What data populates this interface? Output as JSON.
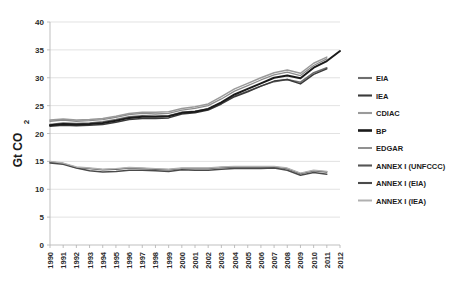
{
  "chart_data": {
    "type": "line",
    "title": "",
    "xlabel": "",
    "ylabel": "Gt CO",
    "ylabel_subscript": "2",
    "ylim": [
      0,
      40
    ],
    "ytick_values": [
      0,
      5,
      10,
      15,
      20,
      25,
      30,
      35,
      40
    ],
    "ytick_labels": [
      "0",
      "5",
      "10",
      "15",
      "20",
      "25",
      "30",
      "35",
      "40"
    ],
    "grid": true,
    "legend_position": "right",
    "x": [
      1990,
      1991,
      1992,
      1993,
      1994,
      1995,
      1996,
      1997,
      1998,
      1999,
      2000,
      2001,
      2002,
      2003,
      2004,
      2005,
      2006,
      2007,
      2008,
      2009,
      2010,
      2011,
      2012
    ],
    "categories": [
      "1990",
      "1991",
      "1992",
      "1993",
      "1994",
      "1995",
      "1996",
      "1997",
      "1998",
      "1999",
      "2000",
      "2001",
      "2002",
      "2003",
      "2004",
      "2005",
      "2006",
      "2007",
      "2008",
      "2009",
      "2010",
      "2011",
      "2012"
    ],
    "series": [
      {
        "name": "EIA",
        "color": "#6e6e6e",
        "width": 1.5,
        "values": [
          21.6,
          21.9,
          21.8,
          21.9,
          22.1,
          22.5,
          23.0,
          23.2,
          23.1,
          23.2,
          23.8,
          24.0,
          24.4,
          25.5,
          26.7,
          27.6,
          28.5,
          29.3,
          29.7,
          29.2,
          30.9,
          31.8,
          null
        ]
      },
      {
        "name": "IEA",
        "color": "#3a3a3a",
        "width": 1.5,
        "values": [
          21.3,
          21.5,
          21.4,
          21.5,
          21.6,
          22.0,
          22.5,
          22.7,
          22.7,
          22.8,
          23.5,
          23.7,
          24.2,
          25.3,
          26.6,
          27.5,
          28.5,
          29.4,
          29.7,
          28.9,
          30.6,
          31.6,
          null
        ]
      },
      {
        "name": "CDIAC",
        "color": "#9a9a9a",
        "width": 1.5,
        "values": [
          22.4,
          22.6,
          22.4,
          22.5,
          22.7,
          23.1,
          23.6,
          23.8,
          23.8,
          23.9,
          24.5,
          24.8,
          25.3,
          26.6,
          28.0,
          29.0,
          30.0,
          30.9,
          31.4,
          30.8,
          32.6,
          33.7,
          null
        ]
      },
      {
        "name": "BP",
        "color": "#1a1a1a",
        "width": 2.0,
        "values": [
          21.5,
          21.7,
          21.6,
          21.7,
          21.9,
          22.3,
          22.8,
          23.0,
          23.0,
          23.1,
          23.7,
          23.9,
          24.4,
          25.6,
          27.0,
          28.0,
          29.0,
          30.0,
          30.4,
          29.9,
          31.8,
          33.0,
          34.8
        ]
      },
      {
        "name": "EDGAR",
        "color": "#8c8c8c",
        "width": 1.3,
        "values": [
          22.2,
          22.4,
          22.2,
          22.3,
          22.5,
          22.9,
          23.4,
          23.6,
          23.5,
          23.6,
          24.2,
          24.5,
          25.0,
          26.2,
          27.6,
          28.6,
          29.6,
          30.5,
          31.0,
          30.4,
          32.2,
          33.4,
          null
        ]
      },
      {
        "name": "ANNEX I (UNFCCC)",
        "color": "#555555",
        "width": 1.5,
        "values": [
          14.9,
          14.6,
          13.9,
          13.7,
          13.5,
          13.6,
          13.8,
          13.7,
          13.6,
          13.5,
          13.7,
          13.7,
          13.7,
          13.9,
          14.0,
          14.0,
          14.0,
          14.0,
          13.7,
          12.8,
          13.3,
          13.1,
          null
        ]
      },
      {
        "name": "ANNEX I (EIA)",
        "color": "#4a4a4a",
        "width": 1.5,
        "values": [
          14.7,
          14.5,
          13.8,
          13.3,
          13.1,
          13.2,
          13.4,
          13.4,
          13.3,
          13.2,
          13.5,
          13.4,
          13.4,
          13.6,
          13.7,
          13.7,
          13.7,
          13.8,
          13.4,
          12.5,
          13.0,
          12.7,
          null
        ]
      },
      {
        "name": "ANNEX I (IEA)",
        "color": "#b0b0b0",
        "width": 1.4,
        "values": [
          15.0,
          14.7,
          14.0,
          13.8,
          13.6,
          13.7,
          13.9,
          13.8,
          13.7,
          13.6,
          13.8,
          13.8,
          13.8,
          14.0,
          14.1,
          14.1,
          14.1,
          14.1,
          13.8,
          12.9,
          13.4,
          13.2,
          null
        ]
      }
    ]
  },
  "legend": {
    "items": [
      {
        "label": "EIA"
      },
      {
        "label": "IEA"
      },
      {
        "label": "CDIAC"
      },
      {
        "label": "BP"
      },
      {
        "label": "EDGAR"
      },
      {
        "label": "ANNEX I (UNFCCC)"
      },
      {
        "label": "ANNEX I (EIA)"
      },
      {
        "label": "ANNEX I (IEA)"
      }
    ]
  }
}
